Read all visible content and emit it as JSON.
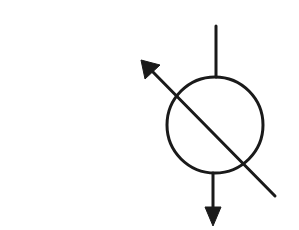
{
  "diagram": {
    "type": "hydraulic-symbol",
    "symbol": "variable-displacement-unit",
    "stroke_color": "#1a1a1a",
    "background_color": "#ffffff",
    "elements": {
      "circle": {
        "cx": 215,
        "cy": 125,
        "r": 48
      },
      "top_line": {
        "x1": 216,
        "y1": 26,
        "x2": 216,
        "y2": 77
      },
      "bottom_line": {
        "x1": 213,
        "y1": 173,
        "x2": 213,
        "y2": 210
      },
      "bottom_arrowhead": {
        "tip": [
          213,
          226
        ],
        "left": [
          205,
          207
        ],
        "right": [
          221,
          207
        ]
      },
      "diagonal_line": {
        "x1": 275,
        "y1": 196,
        "x2": 150,
        "y2": 69
      },
      "diagonal_arrowhead": {
        "tip": [
          141,
          60
        ],
        "left": [
          145,
          78
        ],
        "right": [
          159,
          65
        ]
      }
    }
  }
}
